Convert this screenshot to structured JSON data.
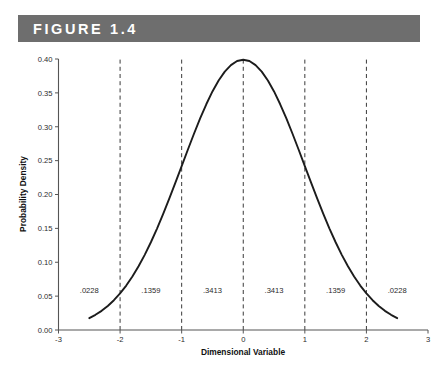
{
  "header": {
    "title": "FIGURE 1.4",
    "bar_color": "#6e6e6e",
    "text_color": "#ffffff"
  },
  "chart_data": {
    "type": "line",
    "title": "FIGURE 1.4",
    "subtitle": "",
    "xlabel": "Dimensional Variable",
    "ylabel": "Probability Density",
    "xlim": [
      -3,
      3
    ],
    "ylim": [
      0.0,
      0.4
    ],
    "grid": false,
    "legend": "none",
    "curve_color": "#1c1c1c",
    "x_ticks": [
      "-3",
      "-2",
      "-1",
      "0",
      "1",
      "2",
      "3"
    ],
    "x_tick_values": [
      -3,
      -2,
      -1,
      0,
      1,
      2,
      3
    ],
    "y_ticks": [
      "0.00",
      "0.05",
      "0.10",
      "0.15",
      "0.20",
      "0.25",
      "0.30",
      "0.35",
      "0.40"
    ],
    "y_tick_values": [
      0.0,
      0.05,
      0.1,
      0.15,
      0.2,
      0.25,
      0.3,
      0.35,
      0.4
    ],
    "series": [
      {
        "name": "standard normal probability density",
        "x": [
          -2.5,
          -2.4,
          -2.3,
          -2.2,
          -2.1,
          -2.0,
          -1.9,
          -1.8,
          -1.7,
          -1.6,
          -1.5,
          -1.4,
          -1.3,
          -1.2,
          -1.1,
          -1.0,
          -0.9,
          -0.8,
          -0.7,
          -0.6,
          -0.5,
          -0.4,
          -0.3,
          -0.2,
          -0.1,
          0.0,
          0.1,
          0.2,
          0.3,
          0.4,
          0.5,
          0.6,
          0.7,
          0.8,
          0.9,
          1.0,
          1.1,
          1.2,
          1.3,
          1.4,
          1.5,
          1.6,
          1.7,
          1.8,
          1.9,
          2.0,
          2.1,
          2.2,
          2.3,
          2.4,
          2.5
        ],
        "values": [
          0.0175,
          0.0224,
          0.0283,
          0.0355,
          0.044,
          0.054,
          0.0656,
          0.079,
          0.094,
          0.1109,
          0.1295,
          0.1497,
          0.1714,
          0.1942,
          0.2179,
          0.242,
          0.2661,
          0.2897,
          0.3123,
          0.3332,
          0.3521,
          0.3683,
          0.3814,
          0.391,
          0.397,
          0.3989,
          0.397,
          0.391,
          0.3814,
          0.3683,
          0.3521,
          0.3332,
          0.3123,
          0.2897,
          0.2661,
          0.242,
          0.2179,
          0.1942,
          0.1714,
          0.1497,
          0.1295,
          0.1109,
          0.094,
          0.079,
          0.0656,
          0.054,
          0.044,
          0.0355,
          0.0283,
          0.0224,
          0.0175
        ]
      }
    ],
    "vertical_dashed_lines": [
      {
        "x": -2,
        "label": "-2"
      },
      {
        "x": -1,
        "label": "-1"
      },
      {
        "x": 0,
        "label": "0"
      },
      {
        "x": 1,
        "label": "1"
      },
      {
        "x": 2,
        "label": "2"
      }
    ],
    "region_labels": [
      {
        "text": ".0228",
        "x": -2.5,
        "y": 0.055
      },
      {
        "text": ".1359",
        "x": -1.5,
        "y": 0.055
      },
      {
        "text": ".3413",
        "x": -0.5,
        "y": 0.055
      },
      {
        "text": ".3413",
        "x": 0.5,
        "y": 0.055
      },
      {
        "text": ".1359",
        "x": 1.5,
        "y": 0.055
      },
      {
        "text": ".0228",
        "x": 2.5,
        "y": 0.055
      }
    ],
    "annotations": [
      "Areas under the standard normal curve between the dashed boundaries are .0228, .1359, .3413, .3413, .1359 and .0228."
    ]
  }
}
